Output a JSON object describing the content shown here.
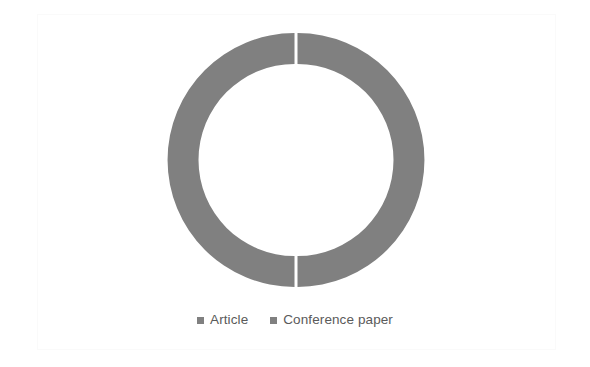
{
  "figure": {
    "clipped_caption_fragment": "·                                                  ·                                  ··",
    "background_color": "#ffffff",
    "frame_color": "#fafafa"
  },
  "chart_data": {
    "type": "pie",
    "variant": "doughnut",
    "title": "",
    "subtitle": "",
    "xlabel": "",
    "ylabel": "",
    "grid": false,
    "legend_position": "bottom",
    "hole_ratio": 0.755,
    "start_angle_deg": 0,
    "categories": [
      "Article",
      "Conference paper"
    ],
    "values": [
      50,
      50
    ],
    "value_unit": "%",
    "data_labels_shown": false,
    "slices": [
      {
        "label": "Article",
        "value": 50,
        "percent": "50%",
        "color": "#808080",
        "start_angle_deg": 0,
        "end_angle_deg": 180
      },
      {
        "label": "Conference paper",
        "value": 50,
        "percent": "50%",
        "color": "#808080",
        "start_angle_deg": 180,
        "end_angle_deg": 360
      }
    ],
    "geometry": {
      "center_x": 296,
      "center_y": 160,
      "outer_radius": 127,
      "inner_radius": 96,
      "slice_gap_px": 3
    }
  },
  "legend": {
    "entries": [
      {
        "label": "Article",
        "swatch_color": "#808080",
        "swatch_name": "legend-swatch-article"
      },
      {
        "label": "Conference paper",
        "swatch_color": "#808080",
        "swatch_name": "legend-swatch-conference-paper"
      }
    ],
    "text_color": "#5a5a5a"
  }
}
